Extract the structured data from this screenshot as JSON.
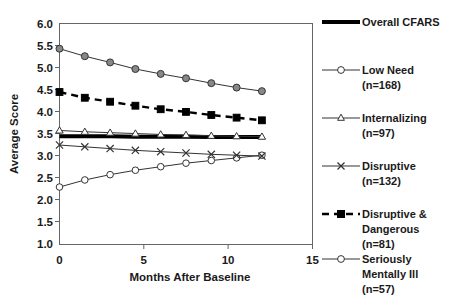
{
  "chart_data": {
    "type": "line",
    "title": "",
    "xlabel": "Months After Baseline",
    "ylabel": "Average Score",
    "xlim": [
      0,
      15
    ],
    "ylim": [
      1.0,
      6.0
    ],
    "xticks": [
      0,
      5,
      10,
      15
    ],
    "xtick_labels": [
      "0",
      "5",
      "10",
      "15"
    ],
    "yticks": [
      1.0,
      1.5,
      2.0,
      2.5,
      3.0,
      3.5,
      4.0,
      4.5,
      5.0,
      5.5,
      6.0
    ],
    "ytick_labels": [
      "1.0",
      "1.5",
      "2.0",
      "2.5",
      "3.0",
      "3.5",
      "4.0",
      "4.5",
      "5.0",
      "5.5",
      "6.0"
    ],
    "grid": false,
    "legend_position": "right",
    "x": [
      0,
      1.5,
      3,
      4.5,
      6,
      7.5,
      9,
      10.5,
      12
    ],
    "series": [
      {
        "name": "Overall CFARS",
        "label": "Overall CFARS",
        "n": null,
        "marker": "none",
        "style": "thick-solid",
        "values": [
          3.45,
          3.45,
          3.45,
          3.44,
          3.44,
          3.44,
          3.43,
          3.43,
          3.43
        ]
      },
      {
        "name": "Low Need",
        "label": "Low Need",
        "n": 168,
        "n_label": "(n=168)",
        "marker": "open-circle",
        "style": "thin-solid",
        "values": [
          2.3,
          2.46,
          2.58,
          2.68,
          2.76,
          2.84,
          2.9,
          2.96,
          3.02
        ]
      },
      {
        "name": "Internalizing",
        "label": "Internalizing",
        "n": 97,
        "n_label": "(n=97)",
        "marker": "open-triangle",
        "style": "thin-solid",
        "values": [
          3.58,
          3.55,
          3.53,
          3.51,
          3.49,
          3.48,
          3.46,
          3.45,
          3.44
        ]
      },
      {
        "name": "Disruptive",
        "label": "Disruptive",
        "n": 132,
        "n_label": "(n=132)",
        "marker": "x",
        "style": "thin-solid",
        "values": [
          3.25,
          3.21,
          3.17,
          3.13,
          3.1,
          3.07,
          3.04,
          3.02,
          3.0
        ]
      },
      {
        "name": "Disruptive & Dangerous",
        "label": "Disruptive &",
        "label2": "Dangerous",
        "n": 81,
        "n_label": "(n=81)",
        "marker": "filled-square",
        "style": "dashed",
        "values": [
          4.45,
          4.32,
          4.23,
          4.14,
          4.06,
          4.0,
          3.93,
          3.87,
          3.81
        ]
      },
      {
        "name": "Seriously Mentally Ill",
        "label": "Seriously",
        "label2": "Mentally Ill",
        "n": 57,
        "n_label": "(n=57)",
        "marker": "gray-circle",
        "style": "thin-solid",
        "values": [
          5.43,
          5.26,
          5.12,
          4.97,
          4.86,
          4.76,
          4.65,
          4.55,
          4.47
        ]
      }
    ]
  },
  "colors": {
    "line_dark": "#333333",
    "line_black": "#000000",
    "marker_gray": "#888888",
    "frame": "#666666",
    "text": "#1a1a1a",
    "background": "#ffffff"
  }
}
